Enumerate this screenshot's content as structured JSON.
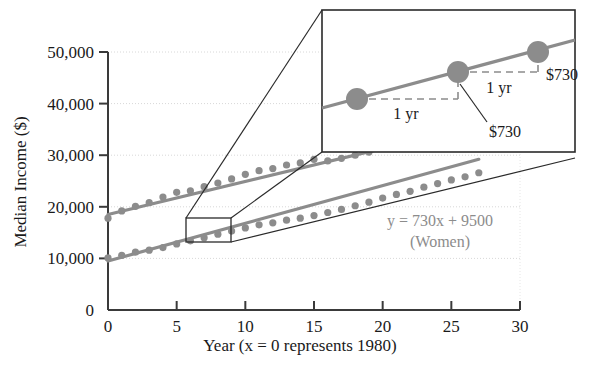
{
  "chart_data": {
    "type": "scatter",
    "title": "",
    "xlabel": "Year (x = 0 represents 1980)",
    "ylabel": "Median Income ($)",
    "xlim": [
      0,
      30
    ],
    "ylim": [
      0,
      50000
    ],
    "grid": true,
    "legend": "none",
    "xticks": [
      "0",
      "5",
      "10",
      "15",
      "20",
      "25",
      "30"
    ],
    "xtick_values": [
      0,
      5,
      10,
      15,
      20,
      25,
      30
    ],
    "yticks": [
      "0",
      "10,000",
      "20,000",
      "30,000",
      "40,000",
      "50,000"
    ],
    "ytick_values": [
      0,
      10000,
      20000,
      30000,
      40000,
      50000
    ],
    "series": [
      {
        "name": "Men",
        "color": "#8c8c8c",
        "x": [
          0,
          1,
          2,
          3,
          4,
          5,
          6,
          7,
          8,
          9,
          10,
          11,
          12,
          13,
          14,
          15,
          16,
          17,
          18,
          19,
          20,
          21,
          22,
          23,
          24,
          25,
          26,
          27
        ],
        "values": [
          17800,
          19200,
          20100,
          20800,
          21900,
          22800,
          23100,
          23900,
          24600,
          25400,
          26300,
          27000,
          27400,
          28100,
          28500,
          29200,
          28900,
          29400,
          30000,
          30600,
          31300,
          31800,
          32500,
          33000,
          33800,
          34500,
          35100,
          35900
        ],
        "trend": {
          "slope": 640,
          "intercept": 18500,
          "x_from": 0,
          "x_to": 27
        }
      },
      {
        "name": "Women",
        "color": "#8c8c8c",
        "x": [
          0,
          1,
          2,
          3,
          4,
          5,
          6,
          7,
          8,
          9,
          10,
          11,
          12,
          13,
          14,
          15,
          16,
          17,
          18,
          19,
          20,
          21,
          22,
          23,
          24,
          25,
          26,
          27
        ],
        "values": [
          10100,
          10600,
          11200,
          11600,
          12100,
          12800,
          13400,
          14000,
          14700,
          15300,
          15900,
          16500,
          16900,
          17400,
          17800,
          18300,
          18900,
          19500,
          20200,
          20900,
          21700,
          22400,
          23000,
          23800,
          24500,
          25200,
          25800,
          26600
        ],
        "trend": {
          "slope": 730,
          "intercept": 9500,
          "x_from": 0,
          "x_to": 27
        }
      }
    ],
    "annotations": {
      "equation": "y = 730x + 9500",
      "equation_subtitle": "(Women)",
      "zoom_box": {
        "x_from": 5.5,
        "x_to": 8.5,
        "y_from": 13800,
        "y_to": 17600
      }
    },
    "inset": {
      "points": [
        {
          "label_x": "",
          "run_label": "1 yr",
          "rise_label": "$730"
        },
        {
          "label_x": "",
          "run_label": "1 yr",
          "rise_label": "$730"
        }
      ],
      "run_label_1": "1 yr",
      "run_label_2": "1 yr",
      "rise_label_1": "$730",
      "rise_label_2": "$730",
      "slope_per_year": 730,
      "description": "Magnified view of the Women trend line showing a rise of $730 for each 1 yr run"
    }
  },
  "axes": {
    "y_title": "Median Income ($)",
    "x_title": "Year (x = 0 represents 1980)",
    "y_ticks": [
      {
        "label": "50,000"
      },
      {
        "label": "40,000"
      },
      {
        "label": "30,000"
      },
      {
        "label": "20,000"
      },
      {
        "label": "10,000"
      },
      {
        "label": "0"
      }
    ],
    "x_ticks": [
      {
        "label": "0"
      },
      {
        "label": "5"
      },
      {
        "label": "10"
      },
      {
        "label": "15"
      },
      {
        "label": "20"
      },
      {
        "label": "25"
      },
      {
        "label": "30"
      }
    ]
  },
  "labels": {
    "equation": "y = 730x + 9500",
    "equation_group": "(Women)",
    "inset_run_left": "1 yr",
    "inset_run_right": "1 yr",
    "inset_rise_right": "$730",
    "inset_rise_center": "$730"
  },
  "colors": {
    "data_gray": "#8c8c8c",
    "line_gray": "#8c8c8c",
    "axis_black": "#3a3a3a",
    "grid_gray": "#d8d8d8",
    "text_black": "#1a1a1a"
  }
}
